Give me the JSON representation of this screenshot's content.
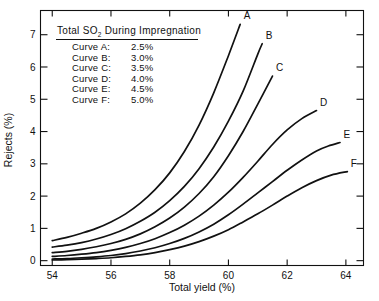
{
  "chart_data": {
    "type": "line",
    "title": "",
    "xlabel": "Total yield (%)",
    "ylabel": "Rejects (%)",
    "xlim": [
      53.6,
      64.6
    ],
    "ylim": [
      -0.15,
      7.75
    ],
    "xticks": [
      "54",
      "56",
      "58",
      "60",
      "62",
      "64"
    ],
    "xtick_values": [
      54,
      56,
      58,
      60,
      62,
      64
    ],
    "yticks": [
      "0",
      "1",
      "2",
      "3",
      "4",
      "5",
      "6",
      "7"
    ],
    "ytick_values": [
      0,
      1,
      2,
      3,
      4,
      5,
      6,
      7
    ],
    "grid": false,
    "legend_position": "inside-top-left",
    "series": [
      {
        "name": "A",
        "label": "A",
        "so2": "2.5%",
        "x": [
          54.0,
          54.5,
          55.0,
          55.5,
          56.0,
          56.5,
          57.0,
          57.5,
          58.0,
          58.5,
          59.0,
          59.5,
          60.0,
          60.4
        ],
        "values": [
          0.62,
          0.72,
          0.85,
          1.0,
          1.2,
          1.45,
          1.78,
          2.2,
          2.72,
          3.38,
          4.2,
          5.2,
          6.35,
          7.32
        ]
      },
      {
        "name": "B",
        "label": "B",
        "so2": "3.0%",
        "x": [
          54.0,
          54.5,
          55.0,
          55.5,
          56.0,
          56.5,
          57.0,
          57.5,
          58.0,
          58.5,
          59.0,
          59.5,
          60.0,
          60.5,
          61.0,
          61.15
        ],
        "values": [
          0.42,
          0.48,
          0.56,
          0.67,
          0.81,
          0.99,
          1.22,
          1.5,
          1.86,
          2.3,
          2.85,
          3.52,
          4.32,
          5.25,
          6.4,
          6.72
        ]
      },
      {
        "name": "C",
        "label": "C",
        "so2": "3.5%",
        "x": [
          54.0,
          54.5,
          55.0,
          55.5,
          56.0,
          56.5,
          57.0,
          57.5,
          58.0,
          58.5,
          59.0,
          59.5,
          60.0,
          60.5,
          61.0,
          61.5
        ],
        "values": [
          0.25,
          0.29,
          0.35,
          0.43,
          0.53,
          0.66,
          0.83,
          1.05,
          1.32,
          1.66,
          2.08,
          2.6,
          3.25,
          4.0,
          4.85,
          5.72
        ]
      },
      {
        "name": "D",
        "label": "D",
        "so2": "4.0%",
        "x": [
          54.0,
          54.5,
          55.0,
          55.5,
          56.0,
          56.5,
          57.0,
          57.5,
          58.0,
          58.5,
          59.0,
          59.5,
          60.0,
          60.5,
          61.0,
          61.5,
          62.0,
          62.5,
          63.0
        ],
        "values": [
          0.13,
          0.16,
          0.2,
          0.25,
          0.32,
          0.41,
          0.53,
          0.68,
          0.87,
          1.1,
          1.38,
          1.72,
          2.12,
          2.58,
          3.08,
          3.6,
          4.05,
          4.4,
          4.65
        ]
      },
      {
        "name": "E",
        "label": "E",
        "so2": "4.5%",
        "x": [
          54.0,
          54.5,
          55.0,
          55.5,
          56.0,
          56.5,
          57.0,
          57.5,
          58.0,
          58.5,
          59.0,
          59.5,
          60.0,
          60.5,
          61.0,
          61.5,
          62.0,
          62.5,
          63.0,
          63.4,
          63.8
        ],
        "values": [
          0.05,
          0.065,
          0.09,
          0.12,
          0.16,
          0.22,
          0.3,
          0.4,
          0.53,
          0.69,
          0.89,
          1.13,
          1.42,
          1.75,
          2.1,
          2.45,
          2.8,
          3.12,
          3.4,
          3.55,
          3.66
        ]
      },
      {
        "name": "F",
        "label": "F",
        "so2": "5.0%",
        "x": [
          54.0,
          54.5,
          55.0,
          55.5,
          56.0,
          56.5,
          57.0,
          57.5,
          58.0,
          58.5,
          59.0,
          59.5,
          60.0,
          60.5,
          61.0,
          61.5,
          62.0,
          62.5,
          63.0,
          63.5,
          64.05
        ],
        "values": [
          0.02,
          0.03,
          0.045,
          0.065,
          0.09,
          0.13,
          0.18,
          0.25,
          0.34,
          0.45,
          0.59,
          0.76,
          0.96,
          1.2,
          1.45,
          1.72,
          2.0,
          2.26,
          2.48,
          2.65,
          2.76
        ]
      }
    ]
  },
  "legend": {
    "title_part1": "Total SO",
    "title_sub": "2",
    "title_part2": " During Impregnation",
    "rows": [
      {
        "name": "Curve A:",
        "value": "2.5%"
      },
      {
        "name": "Curve B:",
        "value": "3.0%"
      },
      {
        "name": "Curve C:",
        "value": "3.5%"
      },
      {
        "name": "Curve D:",
        "value": "4.0%"
      },
      {
        "name": "Curve E:",
        "value": "4.5%"
      },
      {
        "name": "Curve F:",
        "value": "5.0%"
      }
    ]
  }
}
